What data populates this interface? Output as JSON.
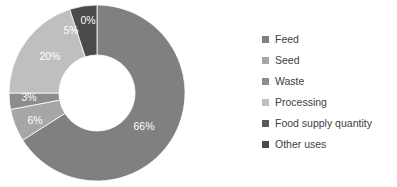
{
  "chart_data": {
    "type": "pie",
    "variant": "donut",
    "title": "",
    "xlabel": "",
    "ylabel": "",
    "legend_position": "right",
    "grid": false,
    "categories": [
      "Feed",
      "Seed",
      "Waste",
      "Processing",
      "Food supply quantity",
      "Other uses"
    ],
    "values": [
      66,
      6,
      3,
      20,
      0,
      5
    ],
    "value_labels": [
      "66%",
      "6%",
      "3%",
      "20%",
      "0%",
      "5%"
    ],
    "units": "percent",
    "colors": [
      "#808080",
      "#a6a6a6",
      "#8c8c8c",
      "#bfbfbf",
      "#595959",
      "#4a4a4a"
    ],
    "slices": [
      {
        "label": "Feed",
        "value": 66,
        "display": "66%",
        "color": "#808080"
      },
      {
        "label": "Seed",
        "value": 6,
        "display": "6%",
        "color": "#a6a6a6"
      },
      {
        "label": "Waste",
        "value": 3,
        "display": "3%",
        "color": "#8c8c8c"
      },
      {
        "label": "Processing",
        "value": 20,
        "display": "20%",
        "color": "#bfbfbf"
      },
      {
        "label": "Food supply quantity",
        "value": 0,
        "display": "0%",
        "color": "#595959"
      },
      {
        "label": "Other uses",
        "value": 5,
        "display": "5%",
        "color": "#4a4a4a"
      }
    ]
  },
  "legend": {
    "items": [
      {
        "label": "Feed",
        "color": "#808080"
      },
      {
        "label": "Seed",
        "color": "#a6a6a6"
      },
      {
        "label": "Waste",
        "color": "#8c8c8c"
      },
      {
        "label": "Processing",
        "color": "#bfbfbf"
      },
      {
        "label": "Food supply quantity",
        "color": "#595959"
      },
      {
        "label": "Other uses",
        "color": "#4a4a4a"
      }
    ]
  },
  "geometry": {
    "cx": 97,
    "cy": 93,
    "outer_radius": 88,
    "inner_radius": 38,
    "label_radius": 63,
    "start_angle_deg": -90
  },
  "style": {
    "background": "#ffffff",
    "label_text_color": "#ffffff",
    "legend_text_color": "#404040"
  }
}
